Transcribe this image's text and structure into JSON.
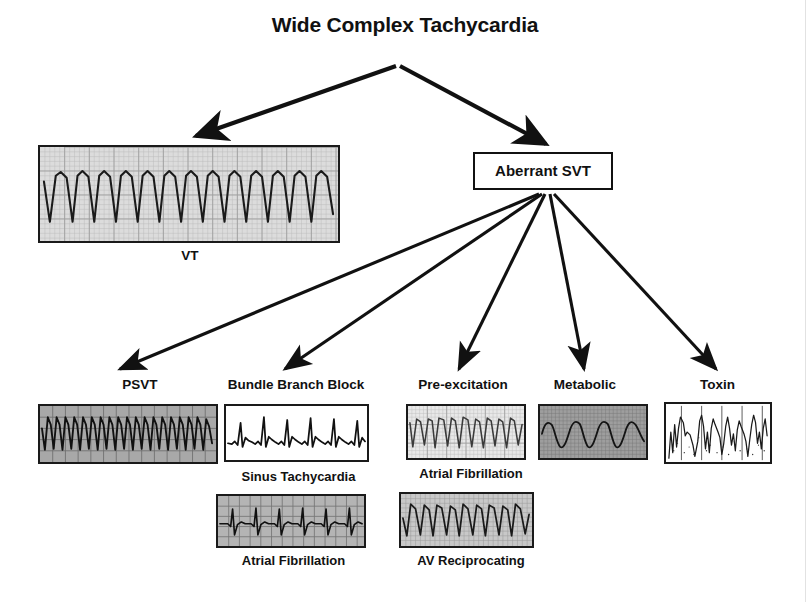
{
  "diagram": {
    "title": "Wide Complex Tachycardia",
    "root_node": "Aberrant SVT"
  },
  "nodes": {
    "vt": {
      "label": "VT",
      "rhythm": "monomorphic-wide-complex",
      "grid": "fine",
      "background": "#dcdcdc"
    },
    "aberrant_svt": {
      "label": "Aberrant SVT"
    }
  },
  "branches": [
    {
      "id": "psvt",
      "label": "PSVT",
      "strip": {
        "rhythm": "narrow-complex-tachycardia",
        "background": "#a8a8a8",
        "grid": "coarse"
      },
      "sub_strips": []
    },
    {
      "id": "bundle-branch-block",
      "label": "Bundle Branch Block",
      "strip": {
        "rhythm": "spiked-qrs",
        "background": "#ffffff",
        "grid": "none"
      },
      "sub_strips": [
        {
          "label": "Sinus Tachycardia",
          "rhythm": "sinus-tachycardia",
          "background": "#b4b4b4",
          "grid": "coarse"
        },
        {
          "label": "Atrial Fibrillation",
          "rhythm": "irregular-af",
          "background": "#b0b0b0",
          "grid": "coarse"
        }
      ]
    },
    {
      "id": "pre-excitation",
      "label": "Pre-excitation",
      "strip": {
        "rhythm": "wide-irregular",
        "background": "#e8e8e8",
        "grid": "fine"
      },
      "sub_strips": [
        {
          "label": "Atrial Fibrillation",
          "rhythm": "irregular-af-wide",
          "background": "#c8c8c8",
          "grid": "fine"
        },
        {
          "label": "AV Reciprocating",
          "rhythm": "regular-sinusoidal",
          "background": "#b8b8b8",
          "grid": "fine"
        }
      ]
    },
    {
      "id": "metabolic",
      "label": "Metabolic",
      "strip": {
        "rhythm": "sine-wave",
        "background": "#9e9e9e",
        "grid": "fine"
      },
      "sub_strips": []
    },
    {
      "id": "toxin",
      "label": "Toxin",
      "strip": {
        "rhythm": "noisy-wide-complex",
        "background": "#ffffff",
        "grid": "vertical"
      },
      "sub_strips": []
    }
  ],
  "sub_captions": {
    "sinus_tachycardia": "Sinus Tachycardia",
    "atrial_fibrillation_bbb": "Atrial Fibrillation",
    "atrial_fibrillation_pre": "Atrial Fibrillation",
    "av_reciprocating": "AV Reciprocating"
  },
  "colors": {
    "ink": "#111111",
    "trace": "#1a1a1a",
    "paper": "#ffffff"
  }
}
